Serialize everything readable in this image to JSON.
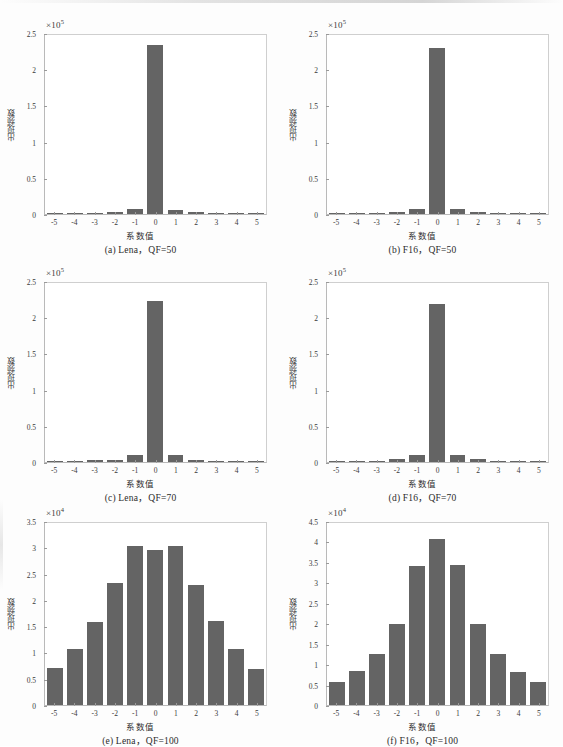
{
  "figure": {
    "x_axis_label": "系数值",
    "y_axis_label": "出现频数",
    "bar_color": "#646464",
    "axis_color": "#b9b9b9",
    "text_color": "#2b2b2b"
  },
  "chart_data": [
    {
      "id": "a",
      "type": "bar",
      "title": "(a) Lena，QF=50",
      "xlabel": "系数值",
      "ylabel": "出现频数",
      "exponent_label": "×10",
      "exponent_power": "5",
      "scale": 100000,
      "categories": [
        "-5",
        "-4",
        "-3",
        "-2",
        "-1",
        "0",
        "1",
        "2",
        "3",
        "4",
        "5"
      ],
      "values": [
        0.012,
        0.012,
        0.018,
        0.03,
        0.065,
        2.33,
        0.062,
        0.025,
        0.013,
        0.01,
        0.01
      ],
      "ylim": [
        0,
        2.5
      ],
      "yticks": [
        "0",
        "0.5",
        "1",
        "1.5",
        "2",
        "2.5"
      ],
      "ytick_values": [
        0,
        0.5,
        1,
        1.5,
        2,
        2.5
      ],
      "grid": false
    },
    {
      "id": "b",
      "type": "bar",
      "title": "(b) F16，QF=50",
      "xlabel": "系数值",
      "ylabel": "出现频数",
      "exponent_label": "×10",
      "exponent_power": "5",
      "scale": 100000,
      "categories": [
        "-5",
        "-4",
        "-3",
        "-2",
        "-1",
        "0",
        "1",
        "2",
        "3",
        "4",
        "5"
      ],
      "values": [
        0.012,
        0.012,
        0.016,
        0.03,
        0.07,
        2.29,
        0.068,
        0.022,
        0.012,
        0.01,
        0.01
      ],
      "ylim": [
        0,
        2.5
      ],
      "yticks": [
        "0",
        "0.5",
        "1",
        "1.5",
        "2",
        "2.5"
      ],
      "ytick_values": [
        0,
        0.5,
        1,
        1.5,
        2,
        2.5
      ],
      "grid": false
    },
    {
      "id": "c",
      "type": "bar",
      "title": "(c) Lena，QF=70",
      "xlabel": "系数值",
      "ylabel": "出现频数",
      "exponent_label": "×10",
      "exponent_power": "5",
      "scale": 100000,
      "categories": [
        "-5",
        "-4",
        "-3",
        "-2",
        "-1",
        "0",
        "1",
        "2",
        "3",
        "4",
        "5"
      ],
      "values": [
        0.014,
        0.014,
        0.028,
        0.03,
        0.1,
        2.22,
        0.1,
        0.03,
        0.016,
        0.012,
        0.01
      ],
      "ylim": [
        0,
        2.5
      ],
      "yticks": [
        "0",
        "0.5",
        "1",
        "1.5",
        "2",
        "2.5"
      ],
      "ytick_values": [
        0,
        0.5,
        1,
        1.5,
        2,
        2.5
      ],
      "grid": false
    },
    {
      "id": "d",
      "type": "bar",
      "title": "(d) F16，QF=70",
      "xlabel": "系数值",
      "ylabel": "出现频数",
      "exponent_label": "×10",
      "exponent_power": "5",
      "scale": 100000,
      "categories": [
        "-5",
        "-4",
        "-3",
        "-2",
        "-1",
        "0",
        "1",
        "2",
        "3",
        "4",
        "5"
      ],
      "values": [
        0.016,
        0.014,
        0.02,
        0.038,
        0.1,
        2.18,
        0.1,
        0.038,
        0.014,
        0.012,
        0.014
      ],
      "ylim": [
        0,
        2.5
      ],
      "yticks": [
        "0",
        "0.5",
        "1",
        "1.5",
        "2",
        "2.5"
      ],
      "ytick_values": [
        0,
        0.5,
        1,
        1.5,
        2,
        2.5
      ],
      "grid": false
    },
    {
      "id": "e",
      "type": "bar",
      "title": "(e) Lena，QF=100",
      "xlabel": "系数值",
      "ylabel": "出现频数",
      "exponent_label": "×10",
      "exponent_power": "4",
      "scale": 10000,
      "categories": [
        "-5",
        "-4",
        "-3",
        "-2",
        "-1",
        "0",
        "1",
        "2",
        "3",
        "4",
        "5"
      ],
      "values": [
        0.7,
        1.07,
        1.58,
        2.33,
        3.03,
        2.94,
        3.03,
        2.28,
        1.6,
        1.06,
        0.69
      ],
      "ylim": [
        0,
        3.5
      ],
      "yticks": [
        "0",
        "0.5",
        "1",
        "1.5",
        "2",
        "2.5",
        "3",
        "3.5"
      ],
      "ytick_values": [
        0,
        0.5,
        1,
        1.5,
        2,
        2.5,
        3,
        3.5
      ],
      "grid": false
    },
    {
      "id": "f",
      "type": "bar",
      "title": "(f) F16，QF=100",
      "xlabel": "系数值",
      "ylabel": "出现频数",
      "exponent_label": "×10",
      "exponent_power": "4",
      "scale": 10000,
      "categories": [
        "-5",
        "-4",
        "-3",
        "-2",
        "-1",
        "0",
        "1",
        "2",
        "3",
        "4",
        "5"
      ],
      "values": [
        0.56,
        0.84,
        1.24,
        1.98,
        3.39,
        4.06,
        3.43,
        1.98,
        1.25,
        0.8,
        0.56
      ],
      "ylim": [
        0,
        4.5
      ],
      "yticks": [
        "0",
        "0.5",
        "1",
        "1.5",
        "2",
        "2.5",
        "3",
        "3.5",
        "4",
        "4.5"
      ],
      "ytick_values": [
        0,
        0.5,
        1,
        1.5,
        2,
        2.5,
        3,
        3.5,
        4,
        4.5
      ],
      "grid": false
    }
  ]
}
